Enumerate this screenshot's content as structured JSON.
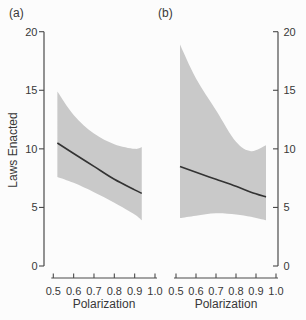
{
  "labels": {
    "panel_a": "(a)",
    "panel_b": "(b)",
    "y_axis": "Laws Enacted",
    "x_axis": "Polarization"
  },
  "colors": {
    "background": "#fcfcfc",
    "band": "#c9c9c9",
    "fit_line": "#333333",
    "axis": "#4a4a4a",
    "text": "#383838"
  },
  "chart_data": [
    {
      "type": "line",
      "panel": "a",
      "panel_label": "(a)",
      "xlabel": "Polarization",
      "ylabel": "Laws Enacted",
      "xlim": [
        0.5,
        1.0
      ],
      "ylim": [
        0,
        20
      ],
      "x_ticks": [
        "0.5",
        "0.6",
        "0.7",
        "0.8",
        "0.9",
        "1.0"
      ],
      "y_ticks": [
        "0",
        "5",
        "10",
        "15",
        "20"
      ],
      "y_axis_side": "left",
      "grid": false,
      "legend": "none",
      "series": {
        "x": [
          0.52,
          0.6,
          0.7,
          0.8,
          0.9,
          0.935
        ],
        "fit": [
          10.5,
          9.6,
          8.5,
          7.4,
          6.5,
          6.2
        ],
        "ci_upper": [
          14.9,
          12.9,
          11.3,
          10.4,
          10.0,
          10.15
        ],
        "ci_lower": [
          7.6,
          7.1,
          6.3,
          5.4,
          4.4,
          3.9
        ]
      }
    },
    {
      "type": "line",
      "panel": "b",
      "panel_label": "(b)",
      "xlabel": "Polarization",
      "ylabel": "Laws Enacted",
      "xlim": [
        0.5,
        1.0
      ],
      "ylim": [
        0,
        20
      ],
      "x_ticks": [
        "0.5",
        "0.6",
        "0.7",
        "0.8",
        "0.9",
        "1.0"
      ],
      "y_ticks": [
        "0",
        "5",
        "10",
        "15",
        "20"
      ],
      "y_axis_side": "right",
      "grid": false,
      "legend": "none",
      "series": {
        "x": [
          0.52,
          0.6,
          0.7,
          0.8,
          0.875,
          0.95
        ],
        "fit": [
          8.5,
          8.0,
          7.4,
          6.8,
          6.3,
          5.9
        ],
        "ci_upper": [
          18.9,
          16.0,
          13.3,
          10.6,
          9.8,
          10.3
        ],
        "ci_lower": [
          4.1,
          4.3,
          4.5,
          4.4,
          4.2,
          3.9
        ]
      }
    }
  ]
}
